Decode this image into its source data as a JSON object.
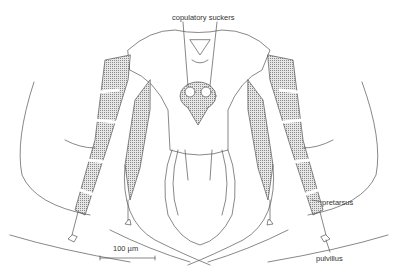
{
  "figure": {
    "labels": {
      "copulatory_suckers": "copulatory suckers",
      "pretarsus": "pretarsus",
      "pulvillus": "pulvillus"
    },
    "scale_bar": {
      "label": "100 µm"
    },
    "colors": {
      "line": "#444444",
      "shading": "#bdbdbd",
      "background": "#ffffff"
    }
  }
}
